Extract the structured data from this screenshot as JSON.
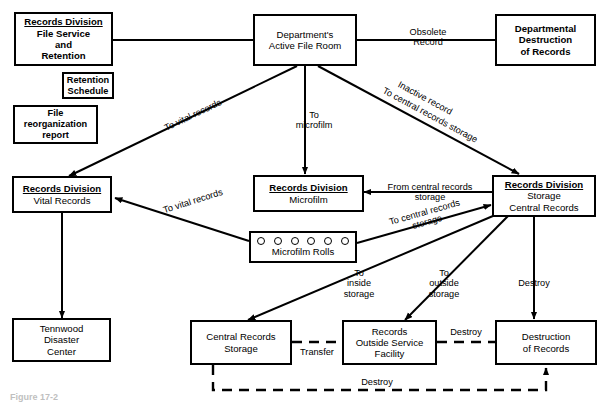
{
  "diagram": {
    "caption": "Figure 17-2",
    "nodes": [
      {
        "id": "file_service",
        "title": "Records Division",
        "lines": [
          "File Service",
          "and",
          "Retention"
        ]
      },
      {
        "id": "retention_sched",
        "title": "",
        "lines": [
          "Retention",
          "Schedule"
        ]
      },
      {
        "id": "file_reorg",
        "title": "",
        "lines": [
          "File",
          "reorganization",
          "report"
        ]
      },
      {
        "id": "active_file_room",
        "title": "",
        "lines": [
          "Department's",
          "Active File Room"
        ]
      },
      {
        "id": "dept_destruction",
        "title": "",
        "lines": [
          "Departmental",
          "Destruction",
          "of Records"
        ]
      },
      {
        "id": "vital_records",
        "title": "Records Division",
        "lines": [
          "Vital Records"
        ]
      },
      {
        "id": "microfilm",
        "title": "Records Division",
        "lines": [
          "Microfilm"
        ]
      },
      {
        "id": "storage_central",
        "title": "Records Division",
        "lines": [
          "Storage",
          "Central Records"
        ]
      },
      {
        "id": "microfilm_rolls",
        "title": "",
        "lines": [
          "Microfilm Rolls"
        ],
        "circles": 6
      },
      {
        "id": "tennwood",
        "title": "",
        "lines": [
          "Tennwood",
          "Disaster",
          "Center"
        ]
      },
      {
        "id": "central_records_storage",
        "title": "",
        "lines": [
          "Central Records",
          "Storage"
        ]
      },
      {
        "id": "outside_service",
        "title": "",
        "lines": [
          "Records",
          "Outside Service",
          "Facility"
        ]
      },
      {
        "id": "destruction_of_records",
        "title": "",
        "lines": [
          "Destruction",
          "of Records"
        ]
      }
    ],
    "edge_labels": {
      "obsolete_record": {
        "line1": "Obsolete",
        "line2": "Record"
      },
      "to_vital_records_top": "To vital records",
      "to_microfilm": {
        "line1": "To",
        "line2": "microfilm"
      },
      "inactive_record": "Inactive record",
      "to_central_records_storage_top": "To central records storage",
      "to_vital_records_rolls": "To vital records",
      "from_central_records_storage": {
        "line1": "From central records",
        "line2": "storage"
      },
      "to_central_records_storage_rolls": {
        "line1": "To central records",
        "line2": "storage"
      },
      "to_inside_storage": {
        "line1": "To",
        "line2": "inside",
        "line3": "storage"
      },
      "to_outside_storage": {
        "line1": "To",
        "line2": "outside",
        "line3": "storage"
      },
      "destroy_vertical": "Destroy",
      "transfer": "Transfer",
      "destroy_outside": "Destroy",
      "destroy_bottom": "Destroy"
    },
    "colors": {
      "stroke": "#000000",
      "background": "#ffffff",
      "text": "#000000"
    }
  }
}
